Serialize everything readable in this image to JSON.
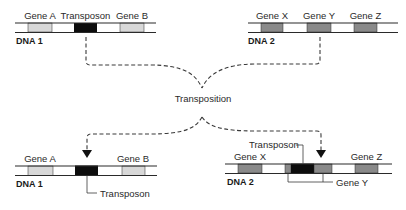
{
  "colors": {
    "gene_light": "#d8d8d8",
    "gene_dark": "#8a8a8a",
    "transposon": "#0d0d0d",
    "line": "#2a2a2a"
  },
  "before": {
    "dna1": {
      "label": "DNA 1",
      "genes": [
        {
          "name": "Gene A"
        },
        {
          "name": "Transposon"
        },
        {
          "name": "Gene B"
        }
      ]
    },
    "dna2": {
      "label": "DNA 2",
      "genes": [
        {
          "name": "Gene X"
        },
        {
          "name": "Gene Y"
        },
        {
          "name": "Gene Z"
        }
      ]
    }
  },
  "process": {
    "label": "Transposition"
  },
  "after": {
    "dna1": {
      "label": "DNA 1",
      "gene_a": "Gene A",
      "gene_b": "Gene B",
      "transposon_label": "Transposon"
    },
    "dna2": {
      "label": "DNA 2",
      "gene_x": "Gene X",
      "gene_z": "Gene Z",
      "transposon_label": "Transposon",
      "gene_y_label": "Gene Y"
    }
  }
}
